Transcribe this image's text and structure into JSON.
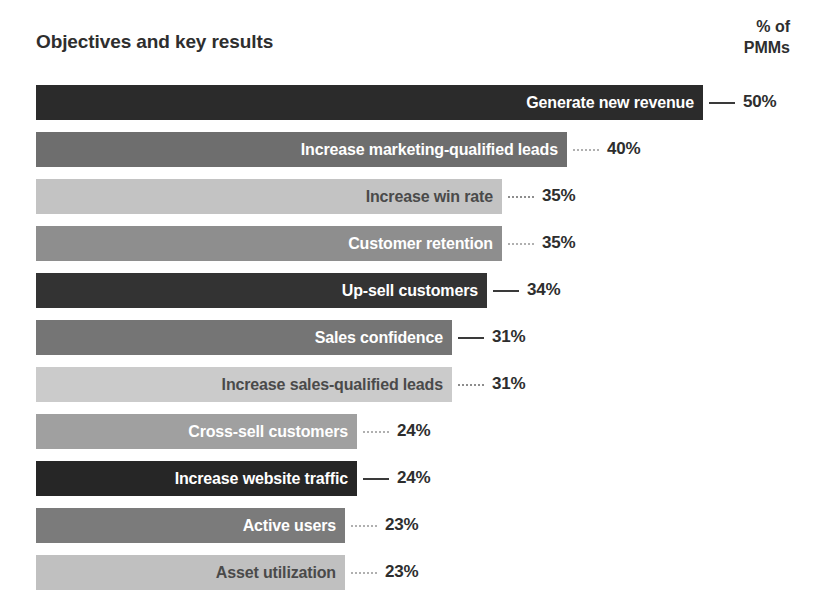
{
  "header": {
    "title": "Objectives and key results",
    "axis_header_line1": "% of",
    "axis_header_line2": "PMMs"
  },
  "chart_data": {
    "type": "bar",
    "orientation": "horizontal",
    "title": "Objectives and key results",
    "xlabel": "% of PMMs",
    "ylabel": "Objectives and key results",
    "xlim": [
      0,
      50
    ],
    "grid": false,
    "legend": null,
    "value_suffix": "%",
    "categories": [
      "Generate new revenue",
      "Increase marketing-qualified leads",
      "Increase win rate",
      "Customer retention",
      "Up-sell customers",
      "Sales confidence",
      "Increase sales-qualified leads",
      "Cross-sell customers",
      "Increase website traffic",
      "Active users",
      "Asset utilization"
    ],
    "values": [
      50,
      40,
      35,
      35,
      34,
      31,
      31,
      24,
      24,
      23,
      23
    ],
    "value_labels": [
      "50%",
      "40%",
      "35%",
      "35%",
      "34%",
      "31%",
      "31%",
      "24%",
      "24%",
      "23%",
      "23%"
    ],
    "bar_colors": [
      "#2b2b2b",
      "#6e6e6e",
      "#c3c3c3",
      "#8e8e8e",
      "#333333",
      "#757575",
      "#cbcbcb",
      "#a0a0a0",
      "#262626",
      "#7b7b7b",
      "#c0c0c0"
    ],
    "bar_widths_px": [
      667,
      531,
      466,
      466,
      451,
      416,
      416,
      321,
      321,
      309,
      309
    ],
    "label_text_colors": [
      "on-dark",
      "on-dark",
      "on-light",
      "on-dark",
      "on-dark",
      "on-dark",
      "on-light",
      "on-dark",
      "on-dark",
      "on-dark",
      "on-light"
    ],
    "connector_styles": [
      "solid-dark",
      "dotted-light",
      "dotted-mid",
      "dotted-light",
      "solid-dark",
      "solid-dark",
      "dotted-mid",
      "dotted-light",
      "solid-dark",
      "dotted-light",
      "dotted-light"
    ]
  },
  "colors": {
    "background": "#ffffff",
    "text": "#2e2e2e",
    "label_on_dark": "#ffffff",
    "label_on_light": "#4a4a4a"
  }
}
